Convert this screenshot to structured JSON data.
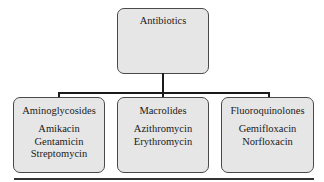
{
  "diagram": {
    "type": "tree",
    "root": {
      "label": "Antibiotics"
    },
    "children": [
      {
        "label": "Aminoglycosides",
        "items": [
          "Amikacin",
          "Gentamicin",
          "Streptomycin"
        ]
      },
      {
        "label": "Macrolides",
        "items": [
          "Azithromycin",
          "Erythromycin"
        ]
      },
      {
        "label": "Fluoroquinolones",
        "items": [
          "Gemifloxacin",
          "Norfloxacin"
        ]
      }
    ],
    "colors": {
      "box_fill": "#e6e6e6",
      "box_border": "#4a4a4a",
      "connector": "#1a1a1a"
    }
  }
}
